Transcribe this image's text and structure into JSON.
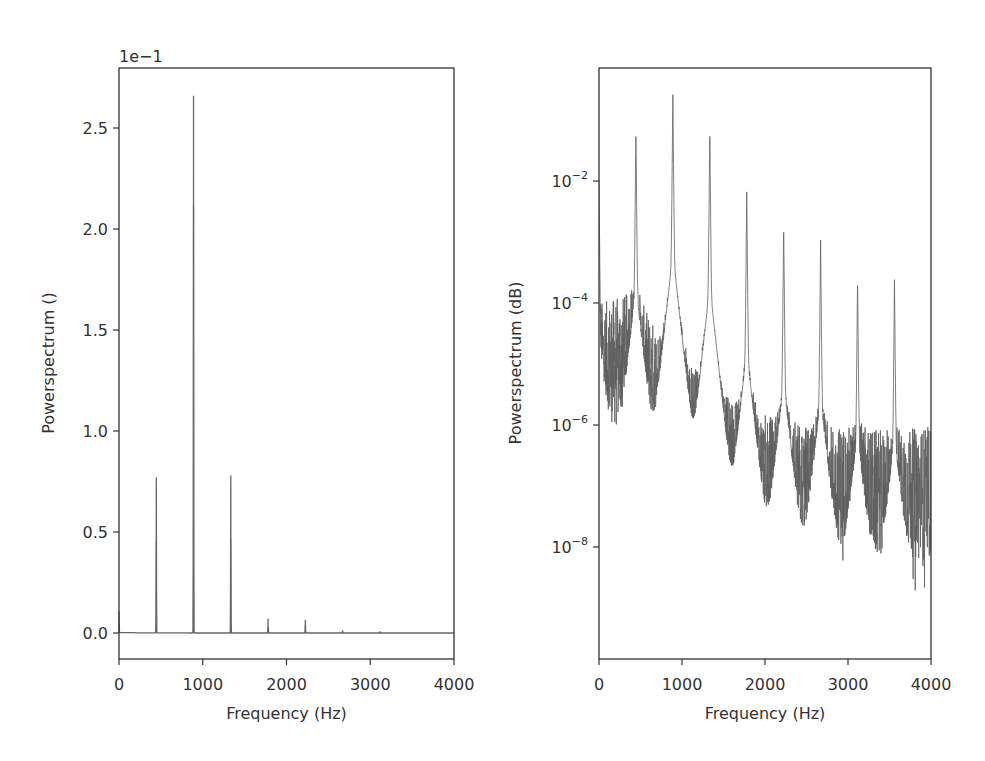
{
  "chart_data": [
    {
      "type": "line",
      "title": "",
      "xlabel": "Frequency (Hz)",
      "ylabel": "Powerspectrum ()",
      "xlim": [
        0,
        4000
      ],
      "ylim": [
        -0.04,
        0.28
      ],
      "yscale": "linear",
      "offset_text": "1e−1",
      "xticks": [
        0,
        1000,
        2000,
        3000,
        4000
      ],
      "xtick_labels": [
        "0",
        "1000",
        "2000",
        "3000",
        "4000"
      ],
      "yticks": [
        0.0,
        0.05,
        0.1,
        0.15,
        0.2,
        0.25
      ],
      "ytick_labels": [
        "0.0",
        "0.5",
        "1.0",
        "1.5",
        "2.0",
        "2.5"
      ],
      "grid": false,
      "series": [
        {
          "name": "power spectrum (linear)",
          "peaks": [
            {
              "x": 0,
              "y": 0.0105
            },
            {
              "x": 445,
              "y": 0.077
            },
            {
              "x": 890,
              "y": 0.266
            },
            {
              "x": 1335,
              "y": 0.078
            },
            {
              "x": 1780,
              "y": 0.0072
            },
            {
              "x": 2225,
              "y": 0.0065
            },
            {
              "x": 2670,
              "y": 0.0012
            },
            {
              "x": 3115,
              "y": 0.0008
            },
            {
              "x": 3560,
              "y": 0.0003
            }
          ]
        }
      ]
    },
    {
      "type": "line",
      "title": "",
      "xlabel": "Frequency (Hz)",
      "ylabel": "Powerspectrum (dB)",
      "xlim": [
        0,
        4000
      ],
      "ylim": [
        1.3e-10,
        5.5
      ],
      "yscale": "log",
      "xticks": [
        0,
        1000,
        2000,
        3000,
        4000
      ],
      "xtick_labels": [
        "0",
        "1000",
        "2000",
        "3000",
        "4000"
      ],
      "yticks": [
        1e-08,
        1e-06,
        0.0001,
        0.01
      ],
      "ytick_labels": [
        "10−8",
        "10−6",
        "10−4",
        "10−2"
      ],
      "grid": false,
      "series": [
        {
          "name": "power spectrum (log)",
          "peaks": [
            {
              "x": 0,
              "y": 0.0105
            },
            {
              "x": 445,
              "y": 0.074
            },
            {
              "x": 890,
              "y": 0.26
            },
            {
              "x": 1335,
              "y": 0.075
            },
            {
              "x": 1780,
              "y": 0.0066
            },
            {
              "x": 2225,
              "y": 0.002
            },
            {
              "x": 2670,
              "y": 0.00107
            },
            {
              "x": 3115,
              "y": 0.00027
            },
            {
              "x": 3560,
              "y": 0.00024
            }
          ],
          "noise_floor": [
            {
              "x": 0,
              "y": 1e-05
            },
            {
              "x": 400,
              "y": 1.5e-05
            },
            {
              "x": 700,
              "y": 4e-06
            },
            {
              "x": 1000,
              "y": 1.5e-06
            },
            {
              "x": 1400,
              "y": 3e-07
            },
            {
              "x": 2000,
              "y": 1.5e-07
            },
            {
              "x": 2500,
              "y": 1e-07
            },
            {
              "x": 3000,
              "y": 1e-07
            },
            {
              "x": 3500,
              "y": 8e-08
            },
            {
              "x": 4000,
              "y": 1e-07
            }
          ]
        }
      ]
    }
  ],
  "figure": {
    "line_color": "#666666",
    "axis_color": "#333333",
    "background": "#ffffff"
  }
}
